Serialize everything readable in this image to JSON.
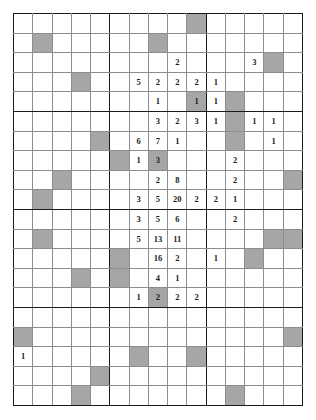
{
  "grid": {
    "rows": 20,
    "cols": 15,
    "block_cols": [
      5,
      10
    ],
    "block_rows": [
      5,
      10,
      15
    ],
    "colors": {
      "line": "#8d8d8d",
      "heavy_line": "#1a1a1a",
      "shade": "#a6a6a6",
      "background": "#ffffff",
      "text": "#1a1a1a"
    },
    "cells": [
      [
        {
          "v": "",
          "s": false
        },
        {
          "v": "",
          "s": false
        },
        {
          "v": "",
          "s": false
        },
        {
          "v": "",
          "s": false
        },
        {
          "v": "",
          "s": false
        },
        {
          "v": "",
          "s": false
        },
        {
          "v": "",
          "s": false
        },
        {
          "v": "",
          "s": false
        },
        {
          "v": "",
          "s": false
        },
        {
          "v": "",
          "s": true
        },
        {
          "v": "",
          "s": false
        },
        {
          "v": "",
          "s": false
        },
        {
          "v": "",
          "s": false
        },
        {
          "v": "",
          "s": false
        },
        {
          "v": "",
          "s": false
        }
      ],
      [
        {
          "v": "",
          "s": false
        },
        {
          "v": "",
          "s": true
        },
        {
          "v": "",
          "s": false
        },
        {
          "v": "",
          "s": false
        },
        {
          "v": "",
          "s": false
        },
        {
          "v": "",
          "s": false
        },
        {
          "v": "",
          "s": false
        },
        {
          "v": "",
          "s": true
        },
        {
          "v": "",
          "s": false
        },
        {
          "v": "",
          "s": false
        },
        {
          "v": "",
          "s": false
        },
        {
          "v": "",
          "s": false
        },
        {
          "v": "",
          "s": false
        },
        {
          "v": "",
          "s": false
        },
        {
          "v": "",
          "s": false
        }
      ],
      [
        {
          "v": "",
          "s": false
        },
        {
          "v": "",
          "s": false
        },
        {
          "v": "",
          "s": false
        },
        {
          "v": "",
          "s": false
        },
        {
          "v": "",
          "s": false
        },
        {
          "v": "",
          "s": false
        },
        {
          "v": "",
          "s": false
        },
        {
          "v": "",
          "s": false
        },
        {
          "v": "2",
          "s": false
        },
        {
          "v": "",
          "s": false
        },
        {
          "v": "",
          "s": false
        },
        {
          "v": "",
          "s": false
        },
        {
          "v": "3",
          "s": false
        },
        {
          "v": "",
          "s": true
        },
        {
          "v": "",
          "s": false
        }
      ],
      [
        {
          "v": "",
          "s": false
        },
        {
          "v": "",
          "s": false
        },
        {
          "v": "",
          "s": false
        },
        {
          "v": "",
          "s": true
        },
        {
          "v": "",
          "s": false
        },
        {
          "v": "",
          "s": false
        },
        {
          "v": "5",
          "s": false
        },
        {
          "v": "2",
          "s": false
        },
        {
          "v": "2",
          "s": false
        },
        {
          "v": "2",
          "s": false
        },
        {
          "v": "1",
          "s": false
        },
        {
          "v": "",
          "s": false
        },
        {
          "v": "",
          "s": false
        },
        {
          "v": "",
          "s": false
        },
        {
          "v": "",
          "s": false
        }
      ],
      [
        {
          "v": "",
          "s": false
        },
        {
          "v": "",
          "s": false
        },
        {
          "v": "",
          "s": false
        },
        {
          "v": "",
          "s": false
        },
        {
          "v": "",
          "s": false
        },
        {
          "v": "",
          "s": false
        },
        {
          "v": "",
          "s": false
        },
        {
          "v": "1",
          "s": false
        },
        {
          "v": "",
          "s": false
        },
        {
          "v": "1",
          "s": true
        },
        {
          "v": "1",
          "s": false
        },
        {
          "v": "",
          "s": true
        },
        {
          "v": "",
          "s": false
        },
        {
          "v": "",
          "s": false
        },
        {
          "v": "",
          "s": false
        }
      ],
      [
        {
          "v": "",
          "s": false
        },
        {
          "v": "",
          "s": false
        },
        {
          "v": "",
          "s": false
        },
        {
          "v": "",
          "s": false
        },
        {
          "v": "",
          "s": false
        },
        {
          "v": "",
          "s": false
        },
        {
          "v": "",
          "s": false
        },
        {
          "v": "3",
          "s": false
        },
        {
          "v": "2",
          "s": false
        },
        {
          "v": "3",
          "s": false
        },
        {
          "v": "1",
          "s": false
        },
        {
          "v": "",
          "s": true
        },
        {
          "v": "1",
          "s": false
        },
        {
          "v": "1",
          "s": false
        },
        {
          "v": "",
          "s": false
        }
      ],
      [
        {
          "v": "",
          "s": false
        },
        {
          "v": "",
          "s": false
        },
        {
          "v": "",
          "s": false
        },
        {
          "v": "",
          "s": false
        },
        {
          "v": "",
          "s": true
        },
        {
          "v": "",
          "s": false
        },
        {
          "v": "6",
          "s": false
        },
        {
          "v": "7",
          "s": false
        },
        {
          "v": "1",
          "s": false
        },
        {
          "v": "",
          "s": false
        },
        {
          "v": "",
          "s": false
        },
        {
          "v": "",
          "s": true
        },
        {
          "v": "",
          "s": false
        },
        {
          "v": "1",
          "s": false
        },
        {
          "v": "",
          "s": false
        }
      ],
      [
        {
          "v": "",
          "s": false
        },
        {
          "v": "",
          "s": false
        },
        {
          "v": "",
          "s": false
        },
        {
          "v": "",
          "s": false
        },
        {
          "v": "",
          "s": false
        },
        {
          "v": "",
          "s": true
        },
        {
          "v": "1",
          "s": false
        },
        {
          "v": "3",
          "s": true
        },
        {
          "v": "",
          "s": false
        },
        {
          "v": "",
          "s": false
        },
        {
          "v": "",
          "s": false
        },
        {
          "v": "2",
          "s": false
        },
        {
          "v": "",
          "s": false
        },
        {
          "v": "",
          "s": false
        },
        {
          "v": "",
          "s": false
        }
      ],
      [
        {
          "v": "",
          "s": false
        },
        {
          "v": "",
          "s": false
        },
        {
          "v": "",
          "s": true
        },
        {
          "v": "",
          "s": false
        },
        {
          "v": "",
          "s": false
        },
        {
          "v": "",
          "s": false
        },
        {
          "v": "",
          "s": false
        },
        {
          "v": "2",
          "s": false
        },
        {
          "v": "8",
          "s": false
        },
        {
          "v": "",
          "s": false
        },
        {
          "v": "",
          "s": false
        },
        {
          "v": "2",
          "s": false
        },
        {
          "v": "",
          "s": false
        },
        {
          "v": "",
          "s": false
        },
        {
          "v": "",
          "s": true
        }
      ],
      [
        {
          "v": "",
          "s": false
        },
        {
          "v": "",
          "s": true
        },
        {
          "v": "",
          "s": false
        },
        {
          "v": "",
          "s": false
        },
        {
          "v": "",
          "s": false
        },
        {
          "v": "",
          "s": false
        },
        {
          "v": "3",
          "s": false
        },
        {
          "v": "5",
          "s": false
        },
        {
          "v": "20",
          "s": false
        },
        {
          "v": "2",
          "s": false
        },
        {
          "v": "2",
          "s": false
        },
        {
          "v": "1",
          "s": false
        },
        {
          "v": "",
          "s": false
        },
        {
          "v": "",
          "s": false
        },
        {
          "v": "",
          "s": false
        }
      ],
      [
        {
          "v": "",
          "s": false
        },
        {
          "v": "",
          "s": false
        },
        {
          "v": "",
          "s": false
        },
        {
          "v": "",
          "s": false
        },
        {
          "v": "",
          "s": false
        },
        {
          "v": "",
          "s": false
        },
        {
          "v": "3",
          "s": false
        },
        {
          "v": "5",
          "s": false
        },
        {
          "v": "6",
          "s": false
        },
        {
          "v": "",
          "s": false
        },
        {
          "v": "",
          "s": false
        },
        {
          "v": "2",
          "s": false
        },
        {
          "v": "",
          "s": false
        },
        {
          "v": "",
          "s": false
        },
        {
          "v": "",
          "s": false
        }
      ],
      [
        {
          "v": "",
          "s": false
        },
        {
          "v": "",
          "s": true
        },
        {
          "v": "",
          "s": false
        },
        {
          "v": "",
          "s": false
        },
        {
          "v": "",
          "s": false
        },
        {
          "v": "",
          "s": false
        },
        {
          "v": "5",
          "s": false
        },
        {
          "v": "13",
          "s": false
        },
        {
          "v": "11",
          "s": false
        },
        {
          "v": "",
          "s": false
        },
        {
          "v": "",
          "s": false
        },
        {
          "v": "",
          "s": false
        },
        {
          "v": "",
          "s": false
        },
        {
          "v": "",
          "s": true
        },
        {
          "v": "",
          "s": true
        }
      ],
      [
        {
          "v": "",
          "s": false
        },
        {
          "v": "",
          "s": false
        },
        {
          "v": "",
          "s": false
        },
        {
          "v": "",
          "s": false
        },
        {
          "v": "",
          "s": false
        },
        {
          "v": "",
          "s": true
        },
        {
          "v": "",
          "s": false
        },
        {
          "v": "16",
          "s": false
        },
        {
          "v": "2",
          "s": false
        },
        {
          "v": "",
          "s": false
        },
        {
          "v": "1",
          "s": false
        },
        {
          "v": "",
          "s": false
        },
        {
          "v": "",
          "s": true
        },
        {
          "v": "",
          "s": false
        },
        {
          "v": "",
          "s": false
        }
      ],
      [
        {
          "v": "",
          "s": false
        },
        {
          "v": "",
          "s": false
        },
        {
          "v": "",
          "s": false
        },
        {
          "v": "",
          "s": true
        },
        {
          "v": "",
          "s": false
        },
        {
          "v": "",
          "s": true
        },
        {
          "v": "",
          "s": false
        },
        {
          "v": "4",
          "s": false
        },
        {
          "v": "1",
          "s": false
        },
        {
          "v": "",
          "s": false
        },
        {
          "v": "",
          "s": false
        },
        {
          "v": "",
          "s": false
        },
        {
          "v": "",
          "s": false
        },
        {
          "v": "",
          "s": false
        },
        {
          "v": "",
          "s": false
        }
      ],
      [
        {
          "v": "",
          "s": false
        },
        {
          "v": "",
          "s": false
        },
        {
          "v": "",
          "s": false
        },
        {
          "v": "",
          "s": false
        },
        {
          "v": "",
          "s": false
        },
        {
          "v": "",
          "s": false
        },
        {
          "v": "1",
          "s": false
        },
        {
          "v": "2",
          "s": true
        },
        {
          "v": "2",
          "s": false
        },
        {
          "v": "2",
          "s": false
        },
        {
          "v": "",
          "s": false
        },
        {
          "v": "",
          "s": false
        },
        {
          "v": "",
          "s": false
        },
        {
          "v": "",
          "s": false
        },
        {
          "v": "",
          "s": false
        }
      ],
      [
        {
          "v": "",
          "s": false
        },
        {
          "v": "",
          "s": false
        },
        {
          "v": "",
          "s": false
        },
        {
          "v": "",
          "s": false
        },
        {
          "v": "",
          "s": false
        },
        {
          "v": "",
          "s": false
        },
        {
          "v": "",
          "s": false
        },
        {
          "v": "",
          "s": false
        },
        {
          "v": "",
          "s": false
        },
        {
          "v": "",
          "s": false
        },
        {
          "v": "",
          "s": false
        },
        {
          "v": "",
          "s": false
        },
        {
          "v": "",
          "s": false
        },
        {
          "v": "",
          "s": false
        },
        {
          "v": "",
          "s": false
        }
      ],
      [
        {
          "v": "",
          "s": true
        },
        {
          "v": "",
          "s": false
        },
        {
          "v": "",
          "s": false
        },
        {
          "v": "",
          "s": false
        },
        {
          "v": "",
          "s": false
        },
        {
          "v": "",
          "s": false
        },
        {
          "v": "",
          "s": false
        },
        {
          "v": "",
          "s": false
        },
        {
          "v": "",
          "s": false
        },
        {
          "v": "",
          "s": false
        },
        {
          "v": "",
          "s": false
        },
        {
          "v": "",
          "s": false
        },
        {
          "v": "",
          "s": false
        },
        {
          "v": "",
          "s": false
        },
        {
          "v": "",
          "s": true
        }
      ],
      [
        {
          "v": "1",
          "s": false
        },
        {
          "v": "",
          "s": false
        },
        {
          "v": "",
          "s": false
        },
        {
          "v": "",
          "s": false
        },
        {
          "v": "",
          "s": false
        },
        {
          "v": "",
          "s": false
        },
        {
          "v": "",
          "s": true
        },
        {
          "v": "",
          "s": false
        },
        {
          "v": "",
          "s": false
        },
        {
          "v": "",
          "s": true
        },
        {
          "v": "",
          "s": false
        },
        {
          "v": "",
          "s": false
        },
        {
          "v": "",
          "s": false
        },
        {
          "v": "",
          "s": false
        },
        {
          "v": "",
          "s": false
        }
      ],
      [
        {
          "v": "",
          "s": false
        },
        {
          "v": "",
          "s": false
        },
        {
          "v": "",
          "s": false
        },
        {
          "v": "",
          "s": false
        },
        {
          "v": "",
          "s": true
        },
        {
          "v": "",
          "s": false
        },
        {
          "v": "",
          "s": false
        },
        {
          "v": "",
          "s": false
        },
        {
          "v": "",
          "s": false
        },
        {
          "v": "",
          "s": false
        },
        {
          "v": "",
          "s": false
        },
        {
          "v": "",
          "s": false
        },
        {
          "v": "",
          "s": false
        },
        {
          "v": "",
          "s": false
        },
        {
          "v": "",
          "s": false
        }
      ],
      [
        {
          "v": "",
          "s": false
        },
        {
          "v": "",
          "s": false
        },
        {
          "v": "",
          "s": false
        },
        {
          "v": "",
          "s": true
        },
        {
          "v": "",
          "s": false
        },
        {
          "v": "",
          "s": false
        },
        {
          "v": "",
          "s": false
        },
        {
          "v": "",
          "s": false
        },
        {
          "v": "",
          "s": false
        },
        {
          "v": "",
          "s": false
        },
        {
          "v": "",
          "s": false
        },
        {
          "v": "",
          "s": true
        },
        {
          "v": "",
          "s": false
        },
        {
          "v": "",
          "s": false
        },
        {
          "v": "",
          "s": false
        }
      ]
    ]
  }
}
